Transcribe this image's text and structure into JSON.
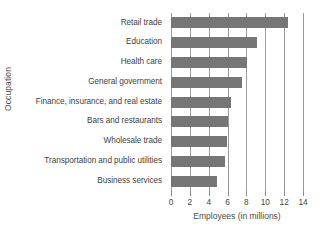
{
  "chart_data": {
    "type": "bar",
    "orientation": "horizontal",
    "title": "",
    "xlabel": "Employees (in millions)",
    "ylabel": "Occupation",
    "categories": [
      "Retail trade",
      "Education",
      "Health care",
      "General government",
      "Finance, insurance, and real estate",
      "Bars and restaurants",
      "Wholesale trade",
      "Transportation and public utilities",
      "Business services"
    ],
    "values": [
      12.4,
      9.1,
      8.1,
      7.5,
      6.4,
      6.0,
      5.9,
      5.7,
      4.9
    ],
    "xlim": [
      0,
      14
    ],
    "xticks": [
      0,
      2,
      4,
      6,
      8,
      10,
      12,
      14
    ],
    "xtick_labels": [
      "0",
      "2",
      "4",
      "6",
      "8",
      "10",
      "12",
      "14"
    ],
    "grid": true,
    "grid_axis": "x",
    "legend": false,
    "bar_color": "#767676",
    "grid_color": "#9a9a9a",
    "background_color": "#ffffff"
  }
}
